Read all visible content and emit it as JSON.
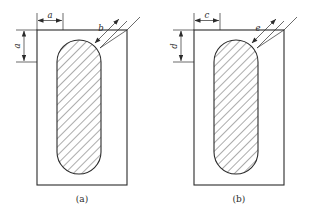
{
  "drawing": {
    "title": "",
    "background_color": "#ffffff",
    "line_color": "#2b2b2b",
    "hatch_color": "#3a3a3a",
    "figures": [
      {
        "id": "figure-a",
        "caption": "(a)",
        "dimensions": [
          {
            "name": "horizontal-top",
            "label": "a",
            "orientation": "horizontal"
          },
          {
            "name": "vertical-left",
            "label": "a",
            "orientation": "vertical"
          },
          {
            "name": "diagonal-corner",
            "label": "b",
            "orientation": "diagonal"
          }
        ]
      },
      {
        "id": "figure-b",
        "caption": "(b)",
        "dimensions": [
          {
            "name": "horizontal-top",
            "label": "c",
            "orientation": "horizontal"
          },
          {
            "name": "vertical-left",
            "label": "d",
            "orientation": "vertical"
          },
          {
            "name": "diagonal-corner",
            "label": "e",
            "orientation": "diagonal"
          }
        ]
      }
    ]
  }
}
